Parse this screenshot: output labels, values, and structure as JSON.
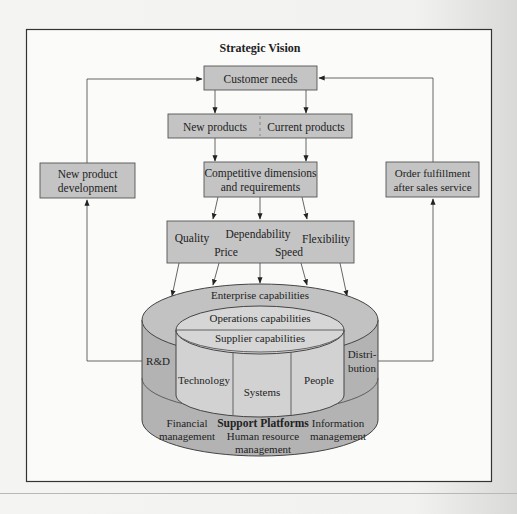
{
  "title": "Strategic Vision",
  "boxes": {
    "customer_needs": "Customer needs",
    "new_products": "New products",
    "current_products": "Current products",
    "competitive": [
      "Competitive dimensions",
      "and requirements"
    ],
    "new_product_dev": [
      "New product",
      "development"
    ],
    "order_fulfillment": [
      "Order fulfillment",
      "after sales service"
    ]
  },
  "dimensions": {
    "quality": "Quality",
    "dependability": "Dependability",
    "flexibility": "Flexibility",
    "price": "Price",
    "speed": "Speed"
  },
  "cylinder": {
    "enterprise": "Enterprise capabilities",
    "operations": "Operations capabilities",
    "supplier": "Supplier capabilities",
    "rd": "R&D",
    "distribution": [
      "Distri-",
      "bution"
    ],
    "technology": "Technology",
    "systems": "Systems",
    "people": "People",
    "support_title": "Support Platforms",
    "financial": [
      "Financial",
      "management"
    ],
    "human_resource": [
      "Human resource",
      "management"
    ],
    "information": [
      "Information",
      "management"
    ]
  },
  "colors": {
    "box_fill": "#c4c4c4",
    "cylinder_outer": "#b3b3b3",
    "cylinder_inner": "#d4d4d4",
    "frame": "#333333"
  }
}
